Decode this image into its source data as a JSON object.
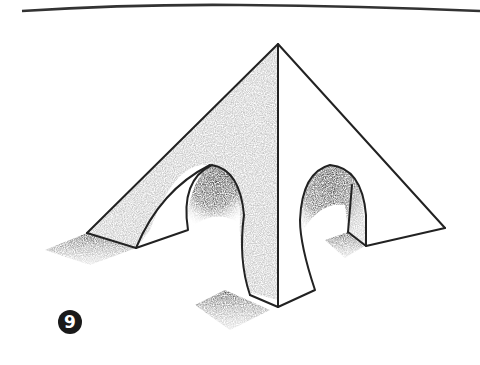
{
  "illustration": {
    "subject": "pyramid with arched openings (pencil sketch)",
    "step_number": "9",
    "colors": {
      "background": "#ffffff",
      "ink": "#222222",
      "shade_light": "#bdbdbd",
      "shade_dark": "#3a3a3a",
      "badge": "#1a1a1a"
    }
  }
}
